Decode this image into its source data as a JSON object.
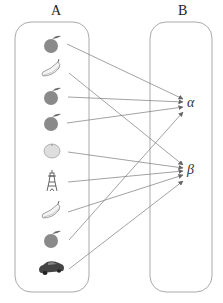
{
  "sets": {
    "A": {
      "label": "A"
    },
    "B": {
      "label": "B"
    }
  },
  "domain_items": [
    {
      "id": "a1",
      "icon": "apple-icon",
      "y": 44,
      "maps_to": "alpha"
    },
    {
      "id": "a2",
      "icon": "banana-icon",
      "y": 70,
      "maps_to": "beta"
    },
    {
      "id": "a3",
      "icon": "apple-icon",
      "y": 96,
      "maps_to": "alpha"
    },
    {
      "id": "a4",
      "icon": "apple-icon",
      "y": 122,
      "maps_to": "alpha"
    },
    {
      "id": "a5",
      "icon": "orange-icon",
      "y": 150,
      "maps_to": "beta"
    },
    {
      "id": "a6",
      "icon": "tower-icon",
      "y": 180,
      "maps_to": "beta"
    },
    {
      "id": "a7",
      "icon": "banana-icon",
      "y": 210,
      "maps_to": "beta"
    },
    {
      "id": "a8",
      "icon": "apple-icon",
      "y": 238,
      "maps_to": "alpha"
    },
    {
      "id": "a9",
      "icon": "car-icon",
      "y": 268,
      "maps_to": "beta"
    }
  ],
  "codomain_items": {
    "alpha": {
      "label": "α",
      "y": 104
    },
    "beta": {
      "label": "β",
      "y": 170
    }
  },
  "colors": {
    "box_border": "#aaaaaa",
    "arrow": "#777777",
    "apple": "#8a8a8a",
    "orange": "#dcdcdc",
    "car": "#444444"
  }
}
